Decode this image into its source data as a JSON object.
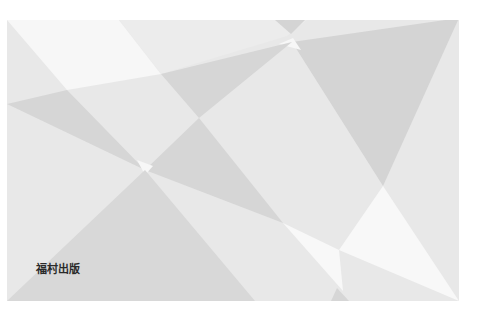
{
  "cover": {
    "publisher": "福村出版",
    "colors": {
      "base": "#e9e9e9",
      "light": "#f8f8f8",
      "mid": "#dcdcdc",
      "dark": "#cfcfcf"
    }
  }
}
